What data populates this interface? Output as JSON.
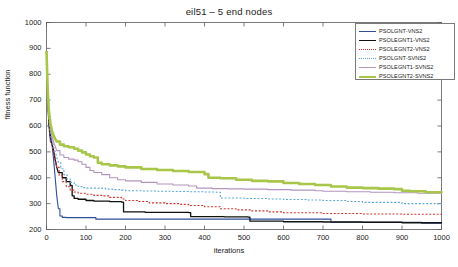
{
  "chart_data": {
    "type": "line",
    "title": "eil51 – 5 end nodes",
    "xlabel": "iterations",
    "ylabel": "fitness function",
    "xlim": [
      0,
      1000
    ],
    "ylim": [
      200,
      1000
    ],
    "xticks": [
      0,
      100,
      200,
      300,
      400,
      500,
      600,
      700,
      800,
      900,
      1000
    ],
    "yticks": [
      200,
      300,
      400,
      500,
      600,
      700,
      800,
      900,
      1000
    ],
    "grid": false,
    "legend_position": "top-right",
    "series": [
      {
        "name": "PSOLGNT-VNS2",
        "color": "#2e4d9b",
        "style": "solid",
        "width": 1.1,
        "x": [
          0,
          3,
          6,
          10,
          14,
          18,
          22,
          26,
          30,
          34,
          40,
          50,
          60,
          80,
          100,
          120,
          125,
          200,
          300,
          360,
          400,
          500,
          600,
          700,
          720,
          800,
          900,
          950,
          1000
        ],
        "y": [
          890,
          700,
          600,
          540,
          530,
          470,
          400,
          330,
          280,
          252,
          247,
          246,
          246,
          246,
          246,
          246,
          240,
          240,
          240,
          240,
          240,
          240,
          240,
          240,
          228,
          228,
          228,
          224,
          222
        ]
      },
      {
        "name": "PSOLEGNT1-VNS2",
        "color": "#111111",
        "style": "solid",
        "width": 1.3,
        "x": [
          0,
          3,
          6,
          10,
          14,
          18,
          22,
          26,
          30,
          40,
          50,
          60,
          65,
          70,
          80,
          100,
          120,
          140,
          160,
          190,
          195,
          250,
          300,
          360,
          365,
          450,
          510,
          515,
          600,
          700,
          800,
          900,
          1000
        ],
        "y": [
          890,
          720,
          620,
          560,
          530,
          505,
          470,
          440,
          420,
          400,
          385,
          370,
          330,
          320,
          317,
          312,
          310,
          310,
          308,
          306,
          268,
          266,
          266,
          265,
          250,
          249,
          248,
          232,
          230,
          229,
          228,
          226,
          224
        ]
      },
      {
        "name": "PSOLEGNT2-VNS2",
        "color": "#d4342a",
        "style": "dotted",
        "width": 1.1,
        "x": [
          0,
          3,
          6,
          10,
          14,
          18,
          22,
          26,
          32,
          40,
          50,
          60,
          70,
          80,
          100,
          120,
          140,
          160,
          190,
          200,
          230,
          260,
          300,
          340,
          360,
          400,
          440,
          480,
          520,
          560,
          600,
          700,
          800,
          900,
          1000
        ],
        "y": [
          890,
          700,
          615,
          555,
          525,
          498,
          470,
          440,
          410,
          385,
          365,
          352,
          345,
          340,
          336,
          332,
          330,
          324,
          318,
          312,
          308,
          303,
          300,
          297,
          293,
          288,
          280,
          276,
          272,
          268,
          265,
          262,
          260,
          259,
          258
        ]
      },
      {
        "name": "PSOLGNT-SVNS2",
        "color": "#5ea8d8",
        "style": "dotted",
        "width": 1.1,
        "x": [
          0,
          3,
          6,
          10,
          14,
          18,
          24,
          30,
          36,
          44,
          52,
          60,
          70,
          80,
          90,
          100,
          120,
          140,
          150,
          170,
          190,
          200,
          240,
          280,
          320,
          360,
          400,
          430,
          440,
          500,
          560,
          600,
          660,
          700,
          760,
          800,
          900,
          1000
        ],
        "y": [
          890,
          720,
          630,
          575,
          545,
          520,
          490,
          460,
          435,
          412,
          395,
          382,
          372,
          366,
          362,
          360,
          360,
          359,
          356,
          354,
          352,
          350,
          349,
          348,
          347,
          346,
          345,
          344,
          322,
          320,
          318,
          316,
          314,
          312,
          308,
          305,
          300,
          297
        ]
      },
      {
        "name": "PSOLEGNT1-SVNS2",
        "color": "#b295bd",
        "style": "solid",
        "width": 1.1,
        "x": [
          0,
          3,
          6,
          10,
          14,
          20,
          26,
          34,
          44,
          56,
          70,
          80,
          90,
          100,
          110,
          120,
          140,
          160,
          180,
          200,
          240,
          280,
          320,
          360,
          380,
          420,
          460,
          500,
          560,
          620,
          680,
          700,
          760,
          820,
          880,
          940,
          1000
        ],
        "y": [
          890,
          730,
          640,
          590,
          560,
          530,
          505,
          488,
          478,
          472,
          468,
          462,
          452,
          440,
          428,
          420,
          412,
          400,
          392,
          388,
          382,
          376,
          372,
          368,
          360,
          358,
          357,
          356,
          354,
          352,
          350,
          348,
          346,
          344,
          342,
          340,
          338
        ]
      },
      {
        "name": "PSOLEGNT2-SVNS2",
        "color": "#a8c64a",
        "style": "solid",
        "width": 2.6,
        "x": [
          0,
          3,
          6,
          10,
          14,
          20,
          26,
          34,
          44,
          56,
          70,
          80,
          90,
          100,
          110,
          120,
          130,
          140,
          160,
          180,
          200,
          240,
          280,
          320,
          360,
          400,
          410,
          440,
          480,
          520,
          560,
          600,
          640,
          680,
          720,
          760,
          800,
          840,
          880,
          900,
          920,
          960,
          1000
        ],
        "y": [
          890,
          740,
          660,
          610,
          580,
          556,
          540,
          528,
          522,
          518,
          512,
          505,
          498,
          490,
          483,
          478,
          458,
          452,
          448,
          444,
          440,
          434,
          430,
          426,
          422,
          414,
          400,
          398,
          392,
          388,
          386,
          380,
          376,
          372,
          366,
          362,
          360,
          358,
          356,
          350,
          348,
          344,
          342
        ]
      }
    ]
  },
  "legend": {
    "entries": [
      {
        "label": "PSOLGNT-VNS2"
      },
      {
        "label": "PSOLEGNT1-VNS2"
      },
      {
        "label": "PSOLEGNT2-VNS2"
      },
      {
        "label": "PSOLGNT-SVNS2"
      },
      {
        "label": "PSOLEGNT1-SVNS2"
      },
      {
        "label": "PSOLEGNT2-SVNS2"
      }
    ]
  },
  "axis_style": {
    "axis_color": "#5a5a5a",
    "background": "#ffffff"
  }
}
